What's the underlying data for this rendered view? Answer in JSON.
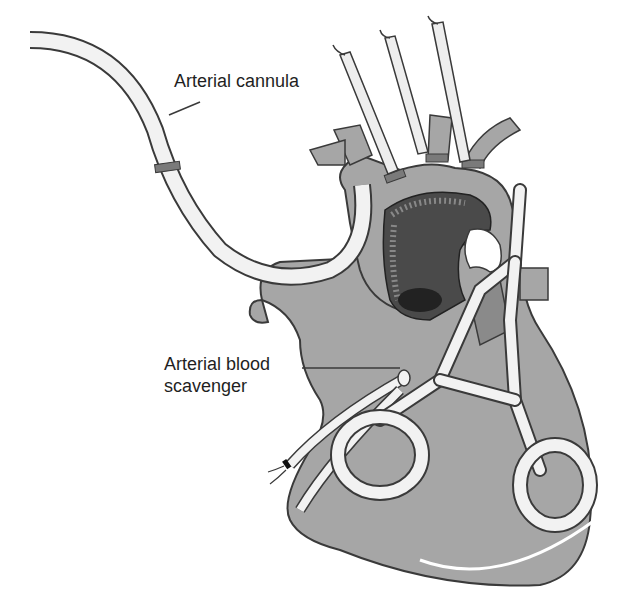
{
  "figure": {
    "type": "medical-illustration"
  },
  "labels": {
    "arterial_cannula": "Arterial cannula",
    "arterial_blood_scavenger_line1": "Arterial blood",
    "arterial_blood_scavenger_line2": "scavenger"
  },
  "colors": {
    "background": "#ffffff",
    "tissue": "#a6a6a6",
    "tissue_dark": "#8a8a8a",
    "aortic_lumen": "#4a4a4a",
    "tube_fill": "#f2f2f2",
    "outline": "#3a3a3a",
    "band": "#7a7a7a"
  }
}
